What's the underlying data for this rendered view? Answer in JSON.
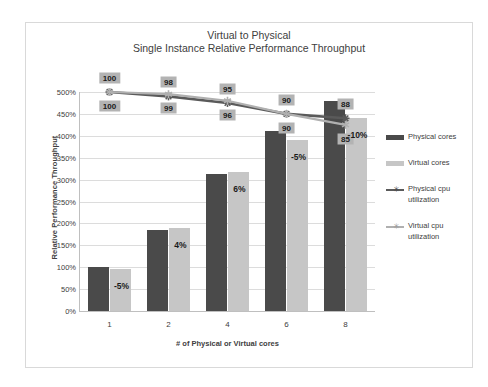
{
  "chart_data": {
    "type": "bar",
    "title": "Virtual to Physical",
    "subtitle": "Single Instance Relative Performance Throughput",
    "xlabel": "# of Physical or Virtual cores",
    "ylabel": "Relative Performance Throughput",
    "categories": [
      "1",
      "2",
      "4",
      "6",
      "8"
    ],
    "ylim": [
      0,
      500
    ],
    "ytick_labels": [
      "0%",
      "50%",
      "100%",
      "150%",
      "200%",
      "250%",
      "300%",
      "350%",
      "400%",
      "450%",
      "500%"
    ],
    "ytick_values": [
      0,
      50,
      100,
      150,
      200,
      250,
      300,
      350,
      400,
      450,
      500
    ],
    "grid": true,
    "legend_position": "right",
    "series": [
      {
        "name": "Physical cores",
        "kind": "bar",
        "color": "#4a4a4a",
        "values": [
          100,
          185,
          313,
          410,
          480
        ]
      },
      {
        "name": "Virtual cores",
        "kind": "bar",
        "color": "#c6c6c6",
        "values": [
          95,
          190,
          318,
          390,
          440
        ]
      },
      {
        "name": "Physical cpu utilization",
        "kind": "line",
        "color": "#5a5a5a",
        "values": [
          100,
          98,
          95,
          90,
          88
        ],
        "point_labels": [
          "100",
          "98",
          "95",
          "90",
          "88"
        ]
      },
      {
        "name": "Virtual cpu utilization",
        "kind": "line",
        "color": "#b0b0b0",
        "values": [
          100,
          99,
          96,
          90,
          85
        ],
        "point_labels": [
          "100",
          "99",
          "96",
          "90",
          "85"
        ]
      }
    ],
    "delta_annotations": [
      "-5%",
      "4%",
      "6%",
      "-5%",
      "-10%"
    ]
  }
}
